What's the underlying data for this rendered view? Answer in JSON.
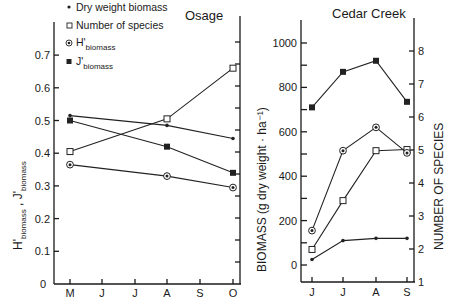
{
  "chart_data": [
    {
      "type": "line",
      "title": "Osage",
      "xlabel": "",
      "ylabel": "H'biomass , J'biomass",
      "categories": [
        "M",
        "J",
        "J",
        "A",
        "S",
        "O"
      ],
      "ylim": [
        0,
        0.78
      ],
      "yticks": [
        "0",
        "0.1",
        "0.2",
        "0.3",
        "0.4",
        "0.5",
        "0.6",
        "0.7"
      ],
      "series": [
        {
          "name": "Dry weight biomass",
          "marker": "dot",
          "x": [
            "M",
            "A",
            "O"
          ],
          "values": [
            0.515,
            0.485,
            0.445
          ]
        },
        {
          "name": "Number of species",
          "marker": "open-square",
          "x": [
            "M",
            "A",
            "O"
          ],
          "values": [
            0.405,
            0.505,
            0.66
          ]
        },
        {
          "name": "H'biomass",
          "marker": "circled-dot",
          "x": [
            "M",
            "A",
            "O"
          ],
          "values": [
            0.365,
            0.33,
            0.295
          ]
        },
        {
          "name": "J'biomass",
          "marker": "filled-square",
          "x": [
            "M",
            "A",
            "O"
          ],
          "values": [
            0.5,
            0.42,
            0.34
          ]
        }
      ],
      "right_axis": {
        "label": "",
        "ticks": 11,
        "unlabeled": true
      },
      "grid": false,
      "legend_position": "upper-left"
    },
    {
      "type": "line",
      "title": "Cedar Creek",
      "xlabel": "",
      "ylabel": "BIOMASS (g dry weight · ha⁻¹)",
      "y2label": "NUMBER OF SPECIES",
      "categories": [
        "J",
        "J",
        "A",
        "S"
      ],
      "ylim": [
        0,
        1100
      ],
      "yticks": [
        "0",
        "200",
        "400",
        "600",
        "800",
        "1000"
      ],
      "y2lim": [
        1,
        8.9
      ],
      "y2ticks": [
        "1",
        "2",
        "3",
        "4",
        "5",
        "6",
        "7",
        "8"
      ],
      "series": [
        {
          "name": "Dry weight biomass",
          "marker": "dot",
          "values": [
            25,
            110,
            120,
            120
          ]
        },
        {
          "name": "Number of species",
          "marker": "open-square",
          "values": [
            70,
            290,
            515,
            520
          ]
        },
        {
          "name": "H'biomass",
          "marker": "circled-dot",
          "values": [
            155,
            515,
            620,
            505
          ]
        },
        {
          "name": "J'biomass",
          "marker": "filled-square",
          "values": [
            710,
            870,
            920,
            735
          ]
        }
      ],
      "grid": false
    }
  ],
  "legend": {
    "items": [
      {
        "symbol": "•",
        "label": "Dry weight biomass"
      },
      {
        "symbol": "□",
        "label": "Number of species"
      },
      {
        "symbol": "⊛",
        "label": "H'",
        "sub": "biomass"
      },
      {
        "symbol": "■",
        "label": "J'",
        "sub": "biomass"
      }
    ]
  },
  "left_panel": {
    "title": "Osage",
    "ylabel_h": "H'",
    "ylabel_sub1": "biomass",
    "ylabel_sep": " , ",
    "ylabel_j": "J'",
    "ylabel_sub2": "biomass",
    "yticks": [
      "0",
      "0.1",
      "0.2",
      "0.3",
      "0.4",
      "0.5",
      "0.6",
      "0.7"
    ],
    "xticks": [
      "M",
      "J",
      "J",
      "A",
      "S",
      "O"
    ]
  },
  "right_panel": {
    "title": "Cedar Creek",
    "ylabel": "BIOMASS  (g  dry  weight · ha⁻¹)",
    "y2label": "NUMBER  OF  SPECIES",
    "yticks": [
      "0",
      "200",
      "400",
      "600",
      "800",
      "1000"
    ],
    "y2ticks": [
      "1",
      "2",
      "3",
      "4",
      "5",
      "6",
      "7",
      "8"
    ],
    "xticks": [
      "J",
      "J",
      "A",
      "S"
    ]
  }
}
